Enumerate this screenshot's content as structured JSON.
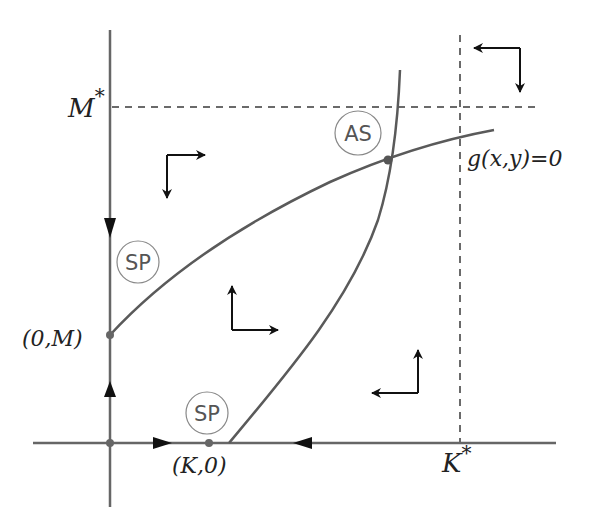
{
  "diagram": {
    "colors": {
      "axis": "#666666",
      "curve": "#5a5a5a",
      "dashed": "#6a6a6a",
      "arrow": "#111111",
      "circle": "#888888",
      "label": "#222222"
    },
    "labels": {
      "m_star": "M",
      "m_star_sup": "*",
      "k_star": "K",
      "k_star_sup": "*",
      "g_nullcline": "g(x,y)=0",
      "point_0m": "(0,M)",
      "point_k0": "(K,0)"
    },
    "equilibria": [
      {
        "id": "origin",
        "x": 110,
        "y": 443,
        "badge": ""
      },
      {
        "id": "0M",
        "x": 110,
        "y": 335,
        "badge": "SP"
      },
      {
        "id": "K0",
        "x": 209,
        "y": 443,
        "badge": "SP"
      },
      {
        "id": "interior",
        "x": 388,
        "y": 160,
        "badge": "AS"
      }
    ],
    "badges": {
      "sp_upper": "SP",
      "sp_lower": "SP",
      "as": "AS"
    },
    "direction_field": [
      {
        "region": "upper-left",
        "horizontal": "right",
        "vertical": "down"
      },
      {
        "region": "middle",
        "horizontal": "right",
        "vertical": "up"
      },
      {
        "region": "lower-right",
        "horizontal": "left",
        "vertical": "up"
      },
      {
        "region": "top-right",
        "horizontal": "left",
        "vertical": "down"
      }
    ],
    "axis_flow": [
      {
        "axis": "y",
        "segment": "above (0,M)",
        "direction": "down"
      },
      {
        "axis": "y",
        "segment": "between origin and (0,M)",
        "direction": "up"
      },
      {
        "axis": "x",
        "segment": "between origin and (K,0)",
        "direction": "right"
      },
      {
        "axis": "x",
        "segment": "right of (K,0)",
        "direction": "left"
      }
    ]
  }
}
